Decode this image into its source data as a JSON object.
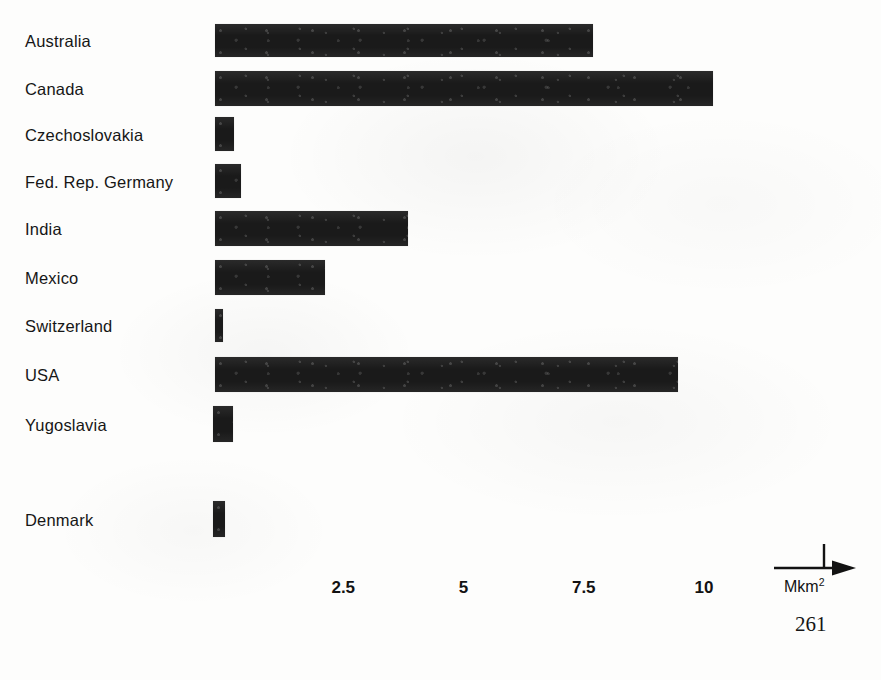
{
  "page": {
    "page_number": "261",
    "background_color": "#fdfdfc",
    "ink_color": "#1a1a1a"
  },
  "axis": {
    "unit_label": "Mkm",
    "unit_exponent": "2",
    "arrow_marker_name": "axis-arrow-marker",
    "tick_labels": [
      "2.5",
      "5",
      "7.5",
      "10"
    ],
    "tick_values": [
      2.5,
      5,
      7.5,
      10
    ]
  },
  "chart_data": {
    "type": "bar",
    "orientation": "horizontal",
    "title": "",
    "subtitle": "",
    "xlabel": "Mkm2",
    "ylabel": "",
    "xlim": [
      0,
      11.5
    ],
    "grid": false,
    "legend": false,
    "categories": [
      "Australia",
      "Canada",
      "Czechoslovakia",
      "Fed. Rep. Germany",
      "India",
      "Mexico",
      "Switzerland",
      "USA",
      "Yugoslavia",
      "Denmark"
    ],
    "values": [
      7.7,
      10.2,
      0.4,
      0.55,
      3.85,
      2.1,
      0.16,
      9.5,
      0.42,
      0.23
    ],
    "bars": [
      {
        "label": "Australia",
        "value": 7.7,
        "px_start": 215,
        "px_end": 593,
        "row_top": 22,
        "bar_top": 24,
        "bar_height": 33
      },
      {
        "label": "Canada",
        "value": 10.2,
        "px_start": 215,
        "px_end": 713,
        "row_top": 70,
        "bar_top": 71,
        "bar_height": 35
      },
      {
        "label": "Czechoslovakia",
        "value": 0.4,
        "px_start": 215,
        "px_end": 234,
        "row_top": 114,
        "bar_top": 117,
        "bar_height": 34
      },
      {
        "label": "Fed. Rep. Germany",
        "value": 0.55,
        "px_start": 215,
        "px_end": 241,
        "row_top": 162,
        "bar_top": 164,
        "bar_height": 34
      },
      {
        "label": "India",
        "value": 3.85,
        "px_start": 215,
        "px_end": 408,
        "row_top": 209,
        "bar_top": 211,
        "bar_height": 35
      },
      {
        "label": "Mexico",
        "value": 2.1,
        "px_start": 215,
        "px_end": 325,
        "row_top": 258,
        "bar_top": 260,
        "bar_height": 35
      },
      {
        "label": "Switzerland",
        "value": 0.16,
        "px_start": 215,
        "px_end": 223,
        "row_top": 306,
        "bar_top": 309,
        "bar_height": 33
      },
      {
        "label": "USA",
        "value": 9.5,
        "px_start": 215,
        "px_end": 678,
        "row_top": 355,
        "bar_top": 357,
        "bar_height": 35
      },
      {
        "label": "Yugoslavia",
        "value": 0.42,
        "px_start": 213,
        "px_end": 233,
        "row_top": 403,
        "bar_top": 406,
        "bar_height": 36
      },
      {
        "label": "Denmark",
        "value": 0.23,
        "px_start": 213,
        "px_end": 225,
        "row_top": 498,
        "bar_top": 501,
        "bar_height": 36
      }
    ],
    "axis_origin_px": 223,
    "px_per_unit": 48.1
  }
}
